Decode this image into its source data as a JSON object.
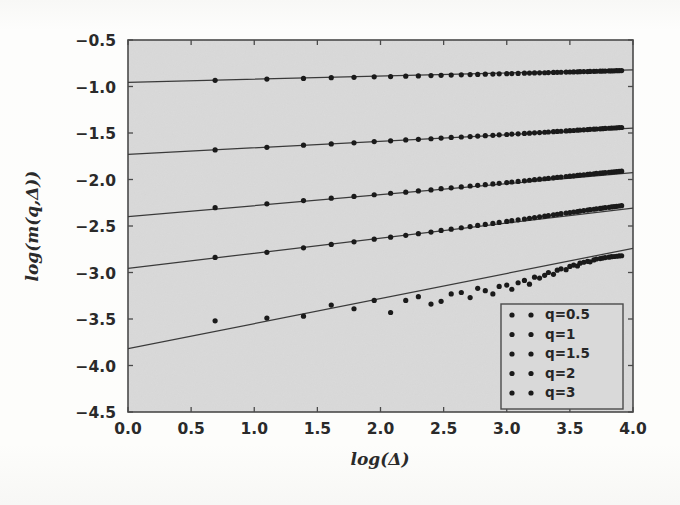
{
  "figure": {
    "background_color": "#fdfdfc",
    "plot_background_color": "#d9d9d9",
    "axis_color": "#3b3b3b",
    "marker_color": "#1a1a1a",
    "line_color": "#3a3a3a"
  },
  "chart_data": {
    "type": "scatter",
    "title": "",
    "xlabel": "log(Δ)",
    "ylabel": "log(m(q,Δ))",
    "xlim": [
      0.0,
      4.0
    ],
    "ylim": [
      -4.5,
      -0.5
    ],
    "xticks": [
      0.0,
      0.5,
      1.0,
      1.5,
      2.0,
      2.5,
      3.0,
      3.5,
      4.0
    ],
    "xticklabels": [
      "0.0",
      "0.5",
      "1.0",
      "1.5",
      "2.0",
      "2.5",
      "3.0",
      "3.5",
      "4.0"
    ],
    "yticks": [
      -0.5,
      -1.0,
      -1.5,
      -2.0,
      -2.5,
      -3.0,
      -3.5,
      -4.0,
      -4.5
    ],
    "yticklabels": [
      "-0.5",
      "-1.0",
      "-1.5",
      "-2.0",
      "-2.5",
      "-3.0",
      "-3.5",
      "-4.0",
      "-4.5"
    ],
    "grid": false,
    "legend_position": "lower right",
    "series": [
      {
        "name": "q=0.5",
        "marker": "dot",
        "fit_intercept": -0.955,
        "fit_slope": 0.0335,
        "x": [
          0.69,
          1.1,
          1.39,
          1.61,
          1.79,
          1.95,
          2.08,
          2.2,
          2.3,
          2.4,
          2.48,
          2.56,
          2.64,
          2.71,
          2.77,
          2.83,
          2.89,
          2.94,
          3.0,
          3.04,
          3.09,
          3.14,
          3.18,
          3.22,
          3.26,
          3.3,
          3.33,
          3.37,
          3.4,
          3.43,
          3.47,
          3.5,
          3.53,
          3.56,
          3.58,
          3.61,
          3.64,
          3.66,
          3.69,
          3.71,
          3.74,
          3.76,
          3.78,
          3.81,
          3.83,
          3.85,
          3.87,
          3.89,
          3.91
        ],
        "y": [
          -0.934,
          -0.92,
          -0.913,
          -0.905,
          -0.901,
          -0.896,
          -0.893,
          -0.889,
          -0.886,
          -0.882,
          -0.88,
          -0.877,
          -0.874,
          -0.872,
          -0.87,
          -0.868,
          -0.866,
          -0.864,
          -0.862,
          -0.861,
          -0.859,
          -0.857,
          -0.856,
          -0.854,
          -0.853,
          -0.852,
          -0.85,
          -0.849,
          -0.848,
          -0.847,
          -0.845,
          -0.844,
          -0.843,
          -0.842,
          -0.841,
          -0.84,
          -0.839,
          -0.838,
          -0.837,
          -0.836,
          -0.835,
          -0.834,
          -0.834,
          -0.833,
          -0.832,
          -0.831,
          -0.83,
          -0.83,
          -0.829
        ]
      },
      {
        "name": "q=1",
        "marker": "dot",
        "fit_intercept": -1.73,
        "fit_slope": 0.0705,
        "x": [
          0.69,
          1.1,
          1.39,
          1.61,
          1.79,
          1.95,
          2.08,
          2.2,
          2.3,
          2.4,
          2.48,
          2.56,
          2.64,
          2.71,
          2.77,
          2.83,
          2.89,
          2.94,
          3.0,
          3.04,
          3.09,
          3.14,
          3.18,
          3.22,
          3.26,
          3.3,
          3.33,
          3.37,
          3.4,
          3.43,
          3.47,
          3.5,
          3.53,
          3.56,
          3.58,
          3.61,
          3.64,
          3.66,
          3.69,
          3.71,
          3.74,
          3.76,
          3.78,
          3.81,
          3.83,
          3.85,
          3.87,
          3.89,
          3.91
        ],
        "y": [
          -1.682,
          -1.654,
          -1.631,
          -1.618,
          -1.606,
          -1.592,
          -1.584,
          -1.574,
          -1.568,
          -1.562,
          -1.555,
          -1.548,
          -1.543,
          -1.538,
          -1.533,
          -1.529,
          -1.525,
          -1.52,
          -1.516,
          -1.512,
          -1.509,
          -1.505,
          -1.502,
          -1.498,
          -1.495,
          -1.492,
          -1.489,
          -1.486,
          -1.483,
          -1.481,
          -1.478,
          -1.475,
          -1.473,
          -1.47,
          -1.468,
          -1.466,
          -1.463,
          -1.461,
          -1.459,
          -1.457,
          -1.455,
          -1.453,
          -1.451,
          -1.449,
          -1.447,
          -1.446,
          -1.444,
          -1.442,
          -1.441
        ]
      },
      {
        "name": "q=1.5",
        "marker": "dot",
        "fit_intercept": -2.4,
        "fit_slope": 0.1185,
        "x": [
          0.69,
          1.1,
          1.39,
          1.61,
          1.79,
          1.95,
          2.08,
          2.2,
          2.3,
          2.4,
          2.48,
          2.56,
          2.64,
          2.71,
          2.77,
          2.83,
          2.89,
          2.94,
          3.0,
          3.04,
          3.09,
          3.14,
          3.18,
          3.22,
          3.26,
          3.3,
          3.33,
          3.37,
          3.4,
          3.43,
          3.47,
          3.5,
          3.53,
          3.56,
          3.58,
          3.61,
          3.64,
          3.66,
          3.69,
          3.71,
          3.74,
          3.76,
          3.78,
          3.81,
          3.83,
          3.85,
          3.87,
          3.89,
          3.91
        ],
        "y": [
          -2.303,
          -2.262,
          -2.227,
          -2.201,
          -2.182,
          -2.164,
          -2.148,
          -2.136,
          -2.123,
          -2.112,
          -2.099,
          -2.09,
          -2.08,
          -2.07,
          -2.063,
          -2.056,
          -2.048,
          -2.041,
          -2.033,
          -2.027,
          -2.021,
          -2.014,
          -2.008,
          -2.002,
          -1.997,
          -1.992,
          -1.987,
          -1.982,
          -1.977,
          -1.973,
          -1.968,
          -1.964,
          -1.96,
          -1.956,
          -1.952,
          -1.949,
          -1.945,
          -1.942,
          -1.938,
          -1.935,
          -1.932,
          -1.929,
          -1.926,
          -1.923,
          -1.92,
          -1.918,
          -1.915,
          -1.913,
          -1.91
        ]
      },
      {
        "name": "q=2",
        "marker": "dot",
        "fit_intercept": -2.955,
        "fit_slope": 0.162,
        "x": [
          0.69,
          1.1,
          1.39,
          1.61,
          1.79,
          1.95,
          2.08,
          2.2,
          2.3,
          2.4,
          2.48,
          2.56,
          2.64,
          2.71,
          2.77,
          2.83,
          2.89,
          2.94,
          3.0,
          3.04,
          3.09,
          3.14,
          3.18,
          3.22,
          3.26,
          3.3,
          3.33,
          3.37,
          3.4,
          3.43,
          3.47,
          3.5,
          3.53,
          3.56,
          3.58,
          3.61,
          3.64,
          3.66,
          3.69,
          3.71,
          3.74,
          3.76,
          3.78,
          3.81,
          3.83,
          3.85,
          3.87,
          3.89,
          3.91
        ],
        "y": [
          -2.838,
          -2.783,
          -2.735,
          -2.698,
          -2.67,
          -2.642,
          -2.62,
          -2.6,
          -2.582,
          -2.565,
          -2.548,
          -2.534,
          -2.519,
          -2.506,
          -2.494,
          -2.483,
          -2.472,
          -2.462,
          -2.451,
          -2.443,
          -2.434,
          -2.425,
          -2.417,
          -2.409,
          -2.401,
          -2.394,
          -2.387,
          -2.38,
          -2.374,
          -2.368,
          -2.361,
          -2.355,
          -2.35,
          -2.344,
          -2.339,
          -2.334,
          -2.329,
          -2.324,
          -2.32,
          -2.315,
          -2.311,
          -2.307,
          -2.303,
          -2.299,
          -2.295,
          -2.292,
          -2.288,
          -2.285,
          -2.281
        ]
      },
      {
        "name": "q=3",
        "marker": "dot",
        "fit_intercept": -3.82,
        "fit_slope": 0.27,
        "x": [
          0.69,
          1.1,
          1.39,
          1.61,
          1.79,
          1.95,
          2.08,
          2.2,
          2.3,
          2.4,
          2.48,
          2.56,
          2.64,
          2.71,
          2.77,
          2.83,
          2.89,
          2.94,
          3.0,
          3.04,
          3.09,
          3.14,
          3.18,
          3.22,
          3.26,
          3.3,
          3.33,
          3.37,
          3.4,
          3.43,
          3.47,
          3.5,
          3.53,
          3.56,
          3.58,
          3.61,
          3.64,
          3.66,
          3.69,
          3.71,
          3.74,
          3.76,
          3.78,
          3.81,
          3.83,
          3.85,
          3.87,
          3.89,
          3.91
        ],
        "y": [
          -3.52,
          -3.49,
          -3.47,
          -3.35,
          -3.39,
          -3.3,
          -3.43,
          -3.3,
          -3.26,
          -3.34,
          -3.31,
          -3.23,
          -3.215,
          -3.27,
          -3.17,
          -3.195,
          -3.23,
          -3.15,
          -3.135,
          -3.18,
          -3.11,
          -3.085,
          -3.125,
          -3.05,
          -3.06,
          -3.03,
          -3.0,
          -3.02,
          -2.975,
          -2.96,
          -2.97,
          -2.935,
          -2.92,
          -2.93,
          -2.9,
          -2.89,
          -2.88,
          -2.885,
          -2.865,
          -2.855,
          -2.85,
          -2.845,
          -2.84,
          -2.835,
          -2.83,
          -2.828,
          -2.825,
          -2.822,
          -2.82
        ]
      }
    ]
  },
  "legend": {
    "entries": [
      {
        "label": "q=0.5"
      },
      {
        "label": "q=1"
      },
      {
        "label": "q=1.5"
      },
      {
        "label": "q=2"
      },
      {
        "label": "q=3"
      }
    ]
  }
}
